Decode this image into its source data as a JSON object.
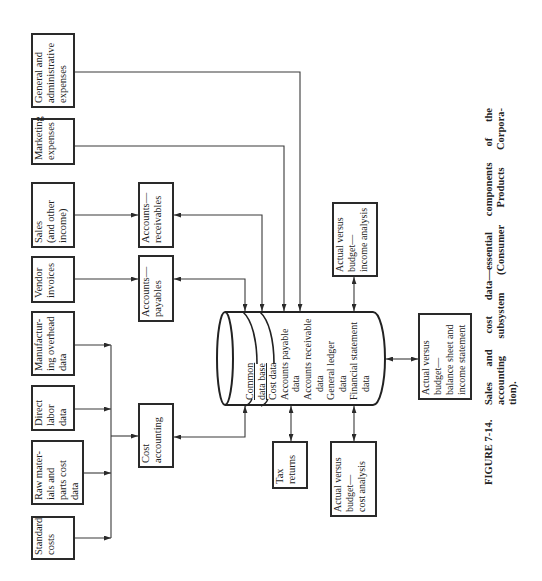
{
  "figure": {
    "label": "FIGURE 7-14.",
    "caption_lines": [
      "Sales and cost data—essential components of the",
      "accounting subsystem (Consumer Products Corpora-",
      "tion)."
    ]
  },
  "sources": [
    {
      "name": "General and administrative expenses",
      "lines": [
        "General and",
        "administrative",
        "expenses"
      ]
    },
    {
      "name": "Marketing expenses",
      "lines": [
        "Marketing",
        "expenses"
      ]
    },
    {
      "name": "Sales (and other income)",
      "lines": [
        "Sales",
        "(and other",
        "income)"
      ]
    },
    {
      "name": "Vendor invoices",
      "lines": [
        "Vendor",
        "invoices"
      ]
    },
    {
      "name": "Manufacturing overhead data",
      "lines": [
        "Manufactur-",
        "ing overhead",
        "data"
      ]
    },
    {
      "name": "Direct labor data",
      "lines": [
        "Direct",
        "labor",
        "data"
      ]
    },
    {
      "name": "Raw materials and parts cost data",
      "lines": [
        "Raw mater-",
        "ials and",
        "parts cost",
        "data"
      ]
    },
    {
      "name": "Standard costs",
      "lines": [
        "Standard",
        "costs"
      ]
    }
  ],
  "processing": [
    {
      "name": "Accounts—receivables",
      "lines": [
        "Accounts—",
        "receivables"
      ]
    },
    {
      "name": "Accounts—payables",
      "lines": [
        "Accounts—",
        "payables"
      ]
    },
    {
      "name": "Cost accounting",
      "lines": [
        "Cost",
        "accounting"
      ]
    }
  ],
  "database": {
    "title_lines": [
      "Common",
      "data base"
    ],
    "items": [
      {
        "lines": [
          "Cost data"
        ]
      },
      {
        "lines": [
          "Accounts payable",
          "data"
        ]
      },
      {
        "lines": [
          "Accounts receivable",
          "data"
        ]
      },
      {
        "lines": [
          "General ledger",
          "data"
        ]
      },
      {
        "lines": [
          "Financial statement",
          "data"
        ]
      }
    ]
  },
  "outputs": [
    {
      "name": "Actual versus budget—income analysis",
      "lines": [
        "Actual versus",
        "budget—",
        "income analysis"
      ]
    },
    {
      "name": "Tax returns",
      "lines": [
        "Tax",
        "returns"
      ]
    },
    {
      "name": "Actual versus budget—cost analysis",
      "lines": [
        "Actual versus",
        "budget—",
        "cost analysis"
      ]
    },
    {
      "name": "Actual versus budget—balance sheet and income statement",
      "lines": [
        "Actual versus",
        "budget—",
        "balance sheet and",
        "income statement"
      ]
    }
  ],
  "connections": [
    {
      "from": "General and administrative expenses",
      "to": "Common data base",
      "arrow": "one-way"
    },
    {
      "from": "Marketing expenses",
      "to": "Common data base",
      "arrow": "one-way"
    },
    {
      "from": "Sales (and other income)",
      "to": "Accounts—receivables",
      "arrow": "one-way"
    },
    {
      "from": "Accounts—receivables",
      "to": "Common data base",
      "arrow": "two-way"
    },
    {
      "from": "Vendor invoices",
      "to": "Accounts—payables",
      "arrow": "one-way"
    },
    {
      "from": "Accounts—payables",
      "to": "Common data base",
      "arrow": "two-way"
    },
    {
      "from": "Manufacturing overhead data",
      "to": "Cost accounting",
      "arrow": "one-way"
    },
    {
      "from": "Direct labor data",
      "to": "Cost accounting",
      "arrow": "one-way"
    },
    {
      "from": "Raw materials and parts cost data",
      "to": "Cost accounting",
      "arrow": "one-way"
    },
    {
      "from": "Standard costs",
      "to": "Cost accounting",
      "arrow": "one-way"
    },
    {
      "from": "Cost accounting",
      "to": "Common data base",
      "arrow": "two-way"
    },
    {
      "from": "Common data base",
      "to": "Actual versus budget—income analysis",
      "arrow": "two-way"
    },
    {
      "from": "Common data base",
      "to": "Tax returns",
      "arrow": "two-way"
    },
    {
      "from": "Common data base",
      "to": "Actual versus budget—cost analysis",
      "arrow": "two-way"
    },
    {
      "from": "Common data base",
      "to": "Actual versus budget—balance sheet and income statement",
      "arrow": "two-way"
    }
  ],
  "colors": {
    "line": "#3a3a3a",
    "border": "#2a2a2a",
    "text": "#222222",
    "background": "#ffffff"
  }
}
